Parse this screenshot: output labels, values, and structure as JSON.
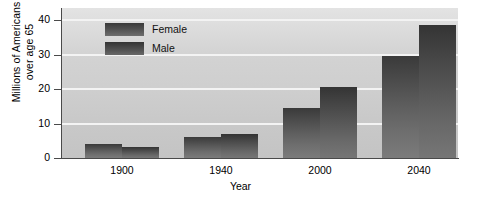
{
  "chart_data": {
    "type": "bar",
    "title": "",
    "xlabel": "Year",
    "ylabel_line1": "Millions of Americans",
    "ylabel_line2": "over age 65",
    "categories": [
      "1900",
      "1940",
      "2000",
      "2040"
    ],
    "series": [
      {
        "name": "Female",
        "values": [
          4.0,
          6.2,
          14.5,
          29.5
        ]
      },
      {
        "name": "Male",
        "values": [
          3.2,
          7.0,
          20.6,
          38.7
        ]
      }
    ],
    "ylim": [
      0,
      43.5
    ],
    "yticks": [
      0,
      10,
      20,
      30,
      40
    ],
    "ytick_labels": [
      "0",
      "10",
      "20",
      "30",
      "40"
    ],
    "grid": true,
    "grid_orientation": "horizontal",
    "legend_position": "upper left inside",
    "colors": {
      "female": "#4a4a4a",
      "male": "#444444",
      "plot_background": "#d3d3d3",
      "gridline": "#f3f3f3",
      "axis": "#4a4a4a",
      "page_background": "#ffffff",
      "text": "#000000"
    }
  },
  "legend": {
    "items": [
      {
        "label": "Female",
        "key": "female"
      },
      {
        "label": "Male",
        "key": "male"
      }
    ]
  }
}
